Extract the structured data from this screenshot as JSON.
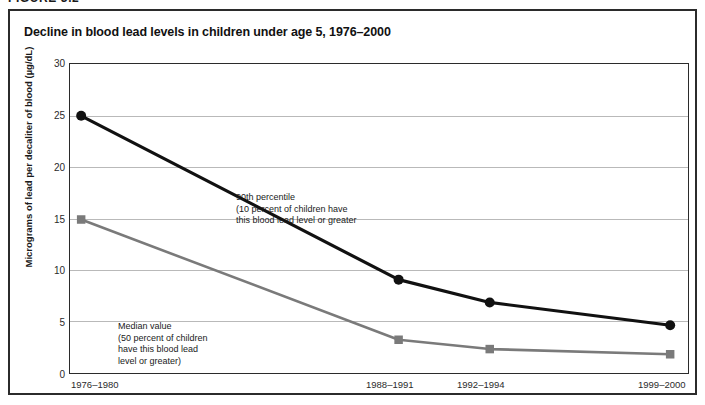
{
  "figure": {
    "label": "FIGURE 3.2",
    "title": "Decline in blood lead levels in children under age 5, 1976–2000"
  },
  "axes": {
    "y_title": "Micrograms of lead per decaliter of blood (µg/dL)",
    "y_ticks": [
      "30",
      "25",
      "20",
      "15",
      "10",
      "5",
      "0"
    ],
    "x_ticks": [
      "1976–1980",
      "1988–1991",
      "1992–1994",
      "1999–2000"
    ]
  },
  "annotations": {
    "p90": "90th percentile\n(10 percent of children have\nthis blood lead level or greater",
    "median": "Median value\n(50 percent of children\nhave this blood lead\nlevel or greater)"
  },
  "chart_data": {
    "type": "line",
    "title": "Decline in blood lead levels in children under age 5, 1976–2000",
    "xlabel": "",
    "ylabel": "Micrograms of lead per decaliter of blood (µg/dL)",
    "categories": [
      "1976–1980",
      "1988–1991",
      "1992–1994",
      "1999–2000"
    ],
    "ylim": [
      0,
      30
    ],
    "ytick_values": [
      0,
      5,
      10,
      15,
      20,
      25,
      30
    ],
    "grid": "horizontal",
    "legend": "none (inline annotations)",
    "series": [
      {
        "name": "90th percentile",
        "description": "(10 percent of children have this blood lead level or greater",
        "values": [
          25.0,
          9.2,
          7.0,
          4.8
        ],
        "color": "#111111",
        "marker": "circle"
      },
      {
        "name": "Median value",
        "description": "(50 percent of children have this blood lead level or greater)",
        "values": [
          15.0,
          3.4,
          2.5,
          2.0
        ],
        "color": "#7a7a7a",
        "marker": "square"
      }
    ]
  }
}
